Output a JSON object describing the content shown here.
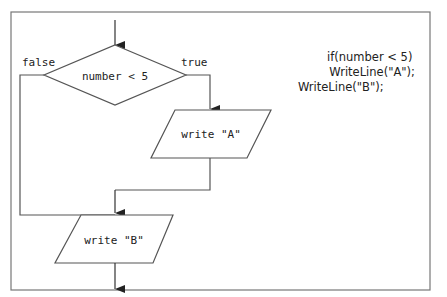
{
  "flowchart": {
    "decision": {
      "label": "number < 5"
    },
    "branches": {
      "false_label": "false",
      "true_label": "true"
    },
    "process_a": {
      "label": "write \"A\""
    },
    "process_b": {
      "label": "write \"B\""
    }
  },
  "code": {
    "lines": [
      "if(number < 5)",
      "  WriteLine(\"A\");",
      "WriteLine(\"B\");"
    ]
  },
  "colors": {
    "stroke": "#555555",
    "frame": "#777777",
    "text": "#222222",
    "background": "#ffffff"
  }
}
